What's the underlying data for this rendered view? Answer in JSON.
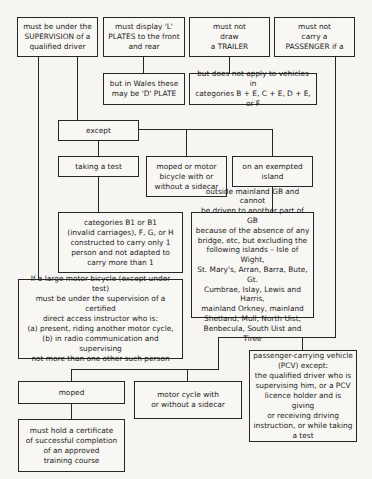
{
  "diagram": {
    "type": "flowchart",
    "boxes": {
      "supervision": "must be under the\nSUPERVISION of a\nqualified driver",
      "l_plates": "must display 'L'\nPLATES to the front\nand rear",
      "trailer": "must not\ndraw\na TRAILER",
      "passenger": "must not\ncarry a\nPASSENGER if a",
      "wales": "but in Wales these\nmay be 'D' PLATE",
      "trailer_exception": "but does not apply to vehicles in\ncategories B + E, C + E, D + E, or F",
      "except": "except",
      "taking_test": "taking a test",
      "moped_or_motorbike": "moped or motor\nbicycle with or\nwithout a sidecar",
      "exempted_island": "on an exempted\nisland",
      "categories_b1": "categories B1 or B1\n(invalid carriages), F, G, or H\nconstructed to carry only 1\nperson and not adapted to\ncarry more than 1",
      "outside_mainland": "outside mainland GB and cannot\nbe driven to another part of GB\nbecause of the absence of any\nbridge, etc, but excluding the\nfollowing islands – Isle of Wight,\nSt. Mary's, Arran, Barra, Bute, Gt.\nCumbrae, Islay, Lewis and Harris,\nmainland Orkney, mainland\nShetland, Mull, North Uist,\nBenbecula, South Uist and Tiree",
      "large_motor_bicycle": "If a large motor bicycle (except under test)\nmust be under the supervision of a certified\ndirect access instructor who is:\n(a) present, riding another motor cycle,\n(b) in radio communication and supervising\nnot more than one other such person",
      "pcv": "passenger-carrying vehicle\n(PCV) except:\nthe qualified driver who is\nsupervising him, or a PCV\nlicence holder and is giving\nor receiving driving\ninstruction, or while taking\na test",
      "moped": "moped",
      "motor_cycle_sidecar": "motor cycle with\nor without a sidecar",
      "certificate": "must hold a certificate\nof successful completion\nof an approved\ntraining course"
    },
    "colors": {
      "background": "#f6f5f2",
      "line": "#262626",
      "text": "#1c1c1c"
    }
  }
}
